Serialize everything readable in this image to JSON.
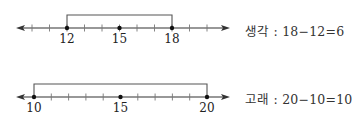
{
  "diagram": {
    "type": "number-line-intervals",
    "lines": [
      {
        "id": "saenggak",
        "axis_y": 28,
        "bracket_top_y": 15,
        "min_value": 9,
        "max_value": 21,
        "origin_value": 12,
        "origin_x": 67,
        "unit_px": 17.5,
        "arrow_left_x": 16,
        "arrow_right_x": 230,
        "tick_values": [
          10,
          11,
          12,
          13,
          14,
          15,
          16,
          17,
          18,
          19,
          20
        ],
        "dot_values": [
          12,
          15,
          18
        ],
        "labels": [
          "12",
          "15",
          "18"
        ],
        "label_values": [
          12,
          15,
          18
        ],
        "bracket": [
          12,
          18
        ],
        "equation_name": "생각",
        "equation_text": "18−12=6",
        "equation_y": 21
      },
      {
        "id": "gorae",
        "axis_y": 97,
        "bracket_top_y": 84,
        "min_value": 9,
        "max_value": 21,
        "origin_value": 10,
        "origin_x": 34,
        "unit_px": 17.3,
        "arrow_left_x": 16,
        "arrow_right_x": 230,
        "tick_values": [
          11,
          12,
          13,
          14,
          16,
          17,
          18,
          19
        ],
        "dot_values": [
          10,
          15,
          20
        ],
        "labels": [
          "10",
          "15",
          "20"
        ],
        "label_values": [
          10,
          15,
          20
        ],
        "bracket": [
          10,
          20
        ],
        "equation_name": "고래",
        "equation_text": "20−10=10",
        "equation_y": 89
      }
    ],
    "separator": " : ",
    "colors": {
      "line": "#333333",
      "bracket": "#555555",
      "dot": "#111111",
      "text": "#333333"
    }
  }
}
